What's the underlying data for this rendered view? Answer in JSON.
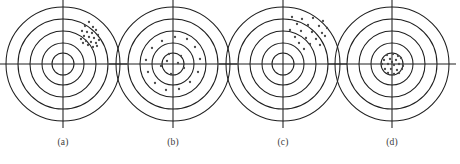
{
  "figure": {
    "title": "",
    "type": "bullseye-target-diagram",
    "background_color": "#ffffff",
    "line_color": "#1f1f1f",
    "shot_color": "#4a4a4a",
    "width": 445,
    "height": 164
  },
  "targets": [
    {
      "id": "a",
      "caption": "(a)",
      "center_x": 63,
      "center_y": 64,
      "caption_x": 43,
      "ring_radii": [
        57,
        45,
        33,
        21,
        11
      ],
      "crosshair_half_length": 64,
      "shots": [
        {
          "x": 22,
          "y": -38
        },
        {
          "x": 26,
          "y": -42
        },
        {
          "x": 30,
          "y": -37
        },
        {
          "x": 19,
          "y": -33
        },
        {
          "x": 24,
          "y": -32
        },
        {
          "x": 29,
          "y": -31
        },
        {
          "x": 33,
          "y": -34
        },
        {
          "x": 21,
          "y": -28
        },
        {
          "x": 26,
          "y": -27
        },
        {
          "x": 31,
          "y": -26
        },
        {
          "x": 35,
          "y": -29
        },
        {
          "x": 23,
          "y": -23
        },
        {
          "x": 28,
          "y": -22
        },
        {
          "x": 33,
          "y": -21
        },
        {
          "x": 18,
          "y": -25
        },
        {
          "x": 36,
          "y": -24
        },
        {
          "x": 25,
          "y": -19
        },
        {
          "x": 30,
          "y": -17
        },
        {
          "x": 34,
          "y": -18
        },
        {
          "x": 20,
          "y": -21
        }
      ]
    },
    {
      "id": "b",
      "caption": "(b)",
      "center_x": 173,
      "center_y": 64,
      "caption_x": 153,
      "ring_radii": [
        57,
        45,
        33,
        21,
        11
      ],
      "crosshair_half_length": 64,
      "shots": [
        {
          "x": 2,
          "y": -27
        },
        {
          "x": 14,
          "y": -25
        },
        {
          "x": 22,
          "y": -17
        },
        {
          "x": 27,
          "y": -5
        },
        {
          "x": 25,
          "y": 8
        },
        {
          "x": 17,
          "y": 18
        },
        {
          "x": 6,
          "y": 25
        },
        {
          "x": -7,
          "y": 26
        },
        {
          "x": -18,
          "y": 19
        },
        {
          "x": -25,
          "y": 8
        },
        {
          "x": -27,
          "y": -4
        },
        {
          "x": -21,
          "y": -16
        },
        {
          "x": -11,
          "y": -23
        },
        {
          "x": -4,
          "y": -10
        },
        {
          "x": 8,
          "y": -8
        },
        {
          "x": 11,
          "y": 4
        },
        {
          "x": -2,
          "y": 10
        },
        {
          "x": -12,
          "y": 2
        },
        {
          "x": 5,
          "y": -1
        },
        {
          "x": -6,
          "y": -3
        }
      ]
    },
    {
      "id": "c",
      "caption": "(c)",
      "center_x": 283,
      "center_y": 64,
      "caption_x": 263,
      "ring_radii": [
        57,
        45,
        33,
        21,
        11
      ],
      "crosshair_half_length": 64,
      "shots": [
        {
          "x": 9,
          "y": -47
        },
        {
          "x": 19,
          "y": -45
        },
        {
          "x": 30,
          "y": -46
        },
        {
          "x": 40,
          "y": -43
        },
        {
          "x": 14,
          "y": -40
        },
        {
          "x": 25,
          "y": -39
        },
        {
          "x": 36,
          "y": -38
        },
        {
          "x": 44,
          "y": -36
        },
        {
          "x": 7,
          "y": -34
        },
        {
          "x": 18,
          "y": -33
        },
        {
          "x": 29,
          "y": -32
        },
        {
          "x": 39,
          "y": -31
        },
        {
          "x": 12,
          "y": -27
        },
        {
          "x": 23,
          "y": -26
        },
        {
          "x": 33,
          "y": -25
        },
        {
          "x": 42,
          "y": -28
        },
        {
          "x": 16,
          "y": -21
        },
        {
          "x": 27,
          "y": -20
        },
        {
          "x": 37,
          "y": -19
        },
        {
          "x": 21,
          "y": -15
        }
      ]
    },
    {
      "id": "d",
      "caption": "(d)",
      "center_x": 392,
      "center_y": 64,
      "caption_x": 372,
      "ring_radii": [
        57,
        45,
        33,
        21,
        11
      ],
      "crosshair_half_length": 64,
      "shots": [
        {
          "x": -5,
          "y": -9
        },
        {
          "x": 1,
          "y": -10
        },
        {
          "x": 6,
          "y": -8
        },
        {
          "x": -8,
          "y": -4
        },
        {
          "x": -2,
          "y": -5
        },
        {
          "x": 4,
          "y": -4
        },
        {
          "x": 9,
          "y": -6
        },
        {
          "x": -10,
          "y": 0
        },
        {
          "x": -4,
          "y": 0
        },
        {
          "x": 2,
          "y": 1
        },
        {
          "x": 7,
          "y": 0
        },
        {
          "x": 11,
          "y": 2
        },
        {
          "x": -7,
          "y": 5
        },
        {
          "x": -1,
          "y": 5
        },
        {
          "x": 5,
          "y": 6
        },
        {
          "x": 10,
          "y": 5
        },
        {
          "x": -4,
          "y": 9
        },
        {
          "x": 2,
          "y": 10
        },
        {
          "x": 7,
          "y": 9
        },
        {
          "x": 0,
          "y": -2
        }
      ]
    }
  ]
}
